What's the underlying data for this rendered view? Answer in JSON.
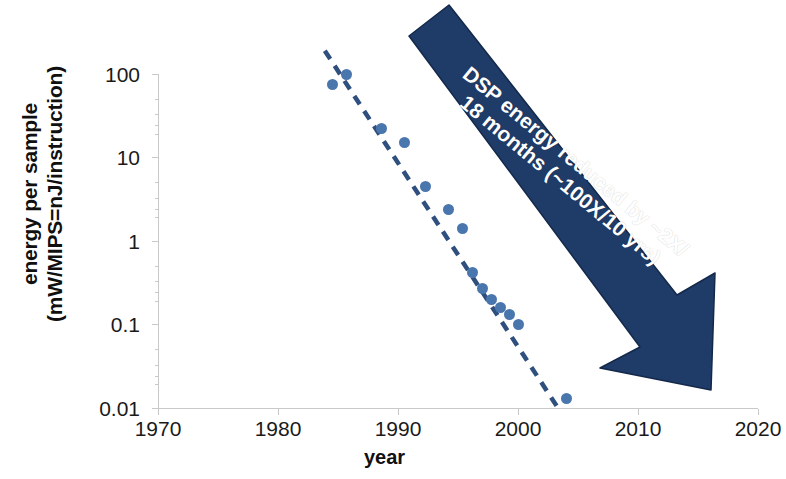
{
  "chart_data": {
    "type": "scatter",
    "title": "",
    "xlabel": "year",
    "ylabel": "energy per sample (mW/MIPS=nJ/instruction)",
    "ylabel_line1": "energy per sample",
    "ylabel_line2": "(mW/MIPS=nJ/instruction)",
    "xlim": [
      1970,
      2020
    ],
    "ylim": [
      0.01,
      100
    ],
    "yscale": "log",
    "xticks": [
      "1970",
      "1980",
      "1990",
      "2000",
      "2010",
      "2020"
    ],
    "yticks": [
      "100",
      "10",
      "1",
      "0.1",
      "0.01"
    ],
    "grid": false,
    "legend": "none",
    "marker_color": "#4a76ae",
    "trendline_color": "#2f4f7f",
    "trendline_style": "dashed",
    "annotation_color": "#1f3b68",
    "annotation_text_color": "#ffffff",
    "series": [
      {
        "name": "DSP energy per sample",
        "x": [
          1984.5,
          1985.7,
          1988.6,
          1990.5,
          1992.3,
          1994.2,
          1995.4,
          1996.2,
          1997.0,
          1997.8,
          1998.5,
          1999.3,
          2000.0,
          2004.0
        ],
        "y": [
          75,
          100,
          22,
          15,
          4.5,
          2.4,
          1.4,
          0.42,
          0.27,
          0.2,
          0.16,
          0.13,
          0.1,
          0.013
        ]
      }
    ],
    "trendline": {
      "x": [
        1983.9,
        2003.5
      ],
      "y": [
        190,
        0.0092
      ],
      "description": "dashed fit line, ~2x reduction every 18 months"
    },
    "annotation": {
      "line1": "DSP energy reduced by ~2X/",
      "line2": "18 months (~100X/10 yrs)",
      "shape": "down-right-arrow"
    }
  }
}
